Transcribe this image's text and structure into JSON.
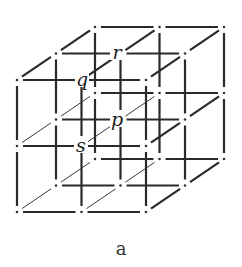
{
  "figure": {
    "caption": "a",
    "grid": {
      "size": 3,
      "origin": [
        17,
        80
      ],
      "step_x": 64.5,
      "step_y": 66,
      "depth_offset": [
        39,
        -26.5
      ],
      "gap": 6
    },
    "labels": [
      {
        "id": "r",
        "text": "r",
        "grid": [
          1,
          0,
          1
        ],
        "x": 117,
        "y": 54
      },
      {
        "id": "q",
        "text": "q",
        "grid": [
          1,
          0,
          0
        ],
        "x": 82,
        "y": 81
      },
      {
        "id": "p",
        "text": "p",
        "grid": [
          1,
          1,
          1
        ],
        "x": 117,
        "y": 121
      },
      {
        "id": "s",
        "text": "s",
        "grid": [
          1,
          1,
          0
        ],
        "x": 81,
        "y": 147
      }
    ],
    "colors": {
      "line": "#2a2a2a",
      "background": "#ffffff"
    }
  }
}
